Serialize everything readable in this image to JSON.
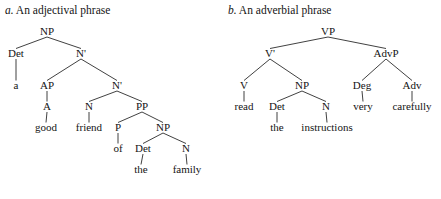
{
  "figure": {
    "panels": [
      {
        "id": "a",
        "caption_letter": "a.",
        "caption_text": " An adjectival phrase",
        "tree": {
          "nodes": [
            {
              "id": "a-np",
              "label": "NP",
              "x": 47,
              "y": 35,
              "kind": "category"
            },
            {
              "id": "a-det",
              "label": "Det",
              "x": 16,
              "y": 57,
              "kind": "category"
            },
            {
              "id": "a-n1a",
              "label": "N'",
              "x": 81,
              "y": 57,
              "kind": "category"
            },
            {
              "id": "a-a-word",
              "label": "a",
              "x": 16,
              "y": 89,
              "kind": "word"
            },
            {
              "id": "a-ap",
              "label": "AP",
              "x": 47,
              "y": 89,
              "kind": "category"
            },
            {
              "id": "a-n1b",
              "label": "N'",
              "x": 117,
              "y": 89,
              "kind": "category"
            },
            {
              "id": "a-adj",
              "label": "A",
              "x": 47,
              "y": 110,
              "kind": "category"
            },
            {
              "id": "a-n",
              "label": "N",
              "x": 89,
              "y": 110,
              "kind": "category"
            },
            {
              "id": "a-pp",
              "label": "PP",
              "x": 142,
              "y": 110,
              "kind": "category"
            },
            {
              "id": "a-good",
              "label": "good",
              "x": 46,
              "y": 131,
              "kind": "word"
            },
            {
              "id": "a-friend",
              "label": "friend",
              "x": 89,
              "y": 131,
              "kind": "word"
            },
            {
              "id": "a-p",
              "label": "P",
              "x": 118,
              "y": 131,
              "kind": "category"
            },
            {
              "id": "a-np2",
              "label": "NP",
              "x": 163,
              "y": 131,
              "kind": "category"
            },
            {
              "id": "a-of",
              "label": "of",
              "x": 118,
              "y": 152,
              "kind": "word"
            },
            {
              "id": "a-det2",
              "label": "Det",
              "x": 143,
              "y": 152,
              "kind": "category"
            },
            {
              "id": "a-n2",
              "label": "N",
              "x": 186,
              "y": 152,
              "kind": "category"
            },
            {
              "id": "a-the",
              "label": "the",
              "x": 141,
              "y": 173,
              "kind": "word"
            },
            {
              "id": "a-family",
              "label": "family",
              "x": 187,
              "y": 173,
              "kind": "word"
            }
          ],
          "edges": [
            {
              "from": "a-np",
              "to": "a-det",
              "type": "branch"
            },
            {
              "from": "a-np",
              "to": "a-n1a",
              "type": "branch"
            },
            {
              "from": "a-det",
              "to": "a-a-word",
              "type": "stem"
            },
            {
              "from": "a-n1a",
              "to": "a-ap",
              "type": "branch"
            },
            {
              "from": "a-n1a",
              "to": "a-n1b",
              "type": "branch"
            },
            {
              "from": "a-ap",
              "to": "a-adj",
              "type": "stem"
            },
            {
              "from": "a-n1b",
              "to": "a-n",
              "type": "branch"
            },
            {
              "from": "a-n1b",
              "to": "a-pp",
              "type": "branch"
            },
            {
              "from": "a-adj",
              "to": "a-good",
              "type": "stem"
            },
            {
              "from": "a-n",
              "to": "a-friend",
              "type": "stem"
            },
            {
              "from": "a-pp",
              "to": "a-p",
              "type": "branch"
            },
            {
              "from": "a-pp",
              "to": "a-np2",
              "type": "branch"
            },
            {
              "from": "a-p",
              "to": "a-of",
              "type": "stem"
            },
            {
              "from": "a-np2",
              "to": "a-det2",
              "type": "branch"
            },
            {
              "from": "a-np2",
              "to": "a-n2",
              "type": "branch"
            },
            {
              "from": "a-det2",
              "to": "a-the",
              "type": "stem"
            },
            {
              "from": "a-n2",
              "to": "a-family",
              "type": "stem"
            }
          ]
        }
      },
      {
        "id": "b",
        "caption_letter": "b.",
        "caption_text": " An adverbial phrase",
        "tree": {
          "nodes": [
            {
              "id": "b-vp",
              "label": "VP",
              "x": 108,
              "y": 35,
              "kind": "category"
            },
            {
              "id": "b-v1",
              "label": "V'",
              "x": 50,
              "y": 57,
              "kind": "category"
            },
            {
              "id": "b-advp",
              "label": "AdvP",
              "x": 166,
              "y": 57,
              "kind": "category"
            },
            {
              "id": "b-v",
              "label": "V",
              "x": 24,
              "y": 89,
              "kind": "category"
            },
            {
              "id": "b-np",
              "label": "NP",
              "x": 82,
              "y": 89,
              "kind": "category"
            },
            {
              "id": "b-deg",
              "label": "Deg",
              "x": 142,
              "y": 89,
              "kind": "category"
            },
            {
              "id": "b-adv",
              "label": "Adv",
              "x": 192,
              "y": 89,
              "kind": "category"
            },
            {
              "id": "b-read",
              "label": "read",
              "x": 24,
              "y": 110,
              "kind": "word"
            },
            {
              "id": "b-det",
              "label": "Det",
              "x": 57,
              "y": 110,
              "kind": "category"
            },
            {
              "id": "b-n",
              "label": "N",
              "x": 106,
              "y": 110,
              "kind": "category"
            },
            {
              "id": "b-very",
              "label": "very",
              "x": 143,
              "y": 110,
              "kind": "word"
            },
            {
              "id": "b-careful",
              "label": "carefully",
              "x": 192,
              "y": 110,
              "kind": "word"
            },
            {
              "id": "b-the",
              "label": "the",
              "x": 57,
              "y": 131,
              "kind": "word"
            },
            {
              "id": "b-instr",
              "label": "instructions",
              "x": 107,
              "y": 131,
              "kind": "word"
            }
          ],
          "edges": [
            {
              "from": "b-vp",
              "to": "b-v1",
              "type": "branch"
            },
            {
              "from": "b-vp",
              "to": "b-advp",
              "type": "branch"
            },
            {
              "from": "b-v1",
              "to": "b-v",
              "type": "branch"
            },
            {
              "from": "b-v1",
              "to": "b-np",
              "type": "branch"
            },
            {
              "from": "b-advp",
              "to": "b-deg",
              "type": "branch"
            },
            {
              "from": "b-advp",
              "to": "b-adv",
              "type": "branch"
            },
            {
              "from": "b-v",
              "to": "b-read",
              "type": "stem"
            },
            {
              "from": "b-np",
              "to": "b-det",
              "type": "branch"
            },
            {
              "from": "b-np",
              "to": "b-n",
              "type": "branch"
            },
            {
              "from": "b-deg",
              "to": "b-very",
              "type": "stem"
            },
            {
              "from": "b-adv",
              "to": "b-careful",
              "type": "stem"
            },
            {
              "from": "b-det",
              "to": "b-the",
              "type": "stem"
            },
            {
              "from": "b-n",
              "to": "b-instr",
              "type": "stem"
            }
          ]
        }
      }
    ]
  },
  "style": {
    "background": "#ffffff",
    "ink": "#141414",
    "line": "#2b2b2b"
  }
}
